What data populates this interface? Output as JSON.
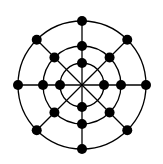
{
  "diagram": {
    "type": "graph",
    "center": [
      82,
      85
    ],
    "rings": [
      {
        "name": "inner",
        "radius": 22,
        "node_angles": [
          0,
          90,
          180,
          270
        ]
      },
      {
        "name": "middle",
        "radius": 39,
        "node_angles": [
          0,
          45,
          90,
          135,
          180,
          225,
          270,
          315
        ]
      },
      {
        "name": "outer",
        "radius": 64,
        "node_angles": [
          0,
          45,
          90,
          135,
          180,
          225,
          270,
          315
        ]
      }
    ],
    "spoke_angles": [
      0,
      45,
      90,
      135,
      180,
      225,
      270,
      315
    ],
    "node_radius": 5,
    "stroke_color": "#000000",
    "node_color": "#000000",
    "node_count": 20
  }
}
